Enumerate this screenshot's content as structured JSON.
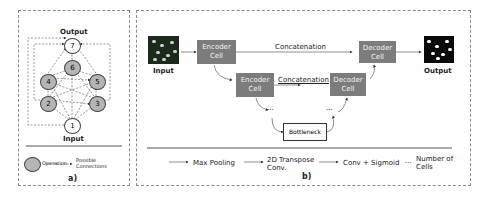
{
  "panel_a": {
    "label": "a)",
    "output_label": "Output",
    "input_label": "Input",
    "nodes": [
      {
        "id": "1",
        "type": "io"
      },
      {
        "id": "2",
        "type": "operation"
      },
      {
        "id": "3",
        "type": "operation"
      },
      {
        "id": "4",
        "type": "operation"
      },
      {
        "id": "5",
        "type": "operation"
      },
      {
        "id": "6",
        "type": "operation"
      },
      {
        "id": "7",
        "type": "io"
      }
    ],
    "legend": {
      "operation": "Operation",
      "connections_line1": "Possible",
      "connections_line2": "Connections"
    }
  },
  "panel_b": {
    "label": "b)",
    "input_label": "Input",
    "output_label": "Output",
    "encoder1_l1": "Encoder",
    "encoder1_l2": "Cell",
    "encoder2_l1": "Encoder",
    "encoder2_l2": "Cell",
    "decoder1_l1": "Decoder",
    "decoder1_l2": "Cell",
    "decoder2_l1": "Decoder",
    "decoder2_l2": "Cell",
    "concat1": "Concatenation",
    "concat2": "Concatenation",
    "bottleneck": "Bottleneck",
    "ellipsis_left": "...",
    "ellipsis_right": "...",
    "legend": {
      "max_pooling": "Max Pooling",
      "transpose_l1": "2D Transpose",
      "transpose_l2": "Conv.",
      "conv_sigmoid": "Conv + Sigmoid",
      "cells_dots": "...",
      "cells_l1": "Number of",
      "cells_l2": "Cells"
    }
  },
  "colors": {
    "cell_fill": "#7c7c7c",
    "operation_fill": "#b5b5b5",
    "border": "#8a8a8a"
  }
}
